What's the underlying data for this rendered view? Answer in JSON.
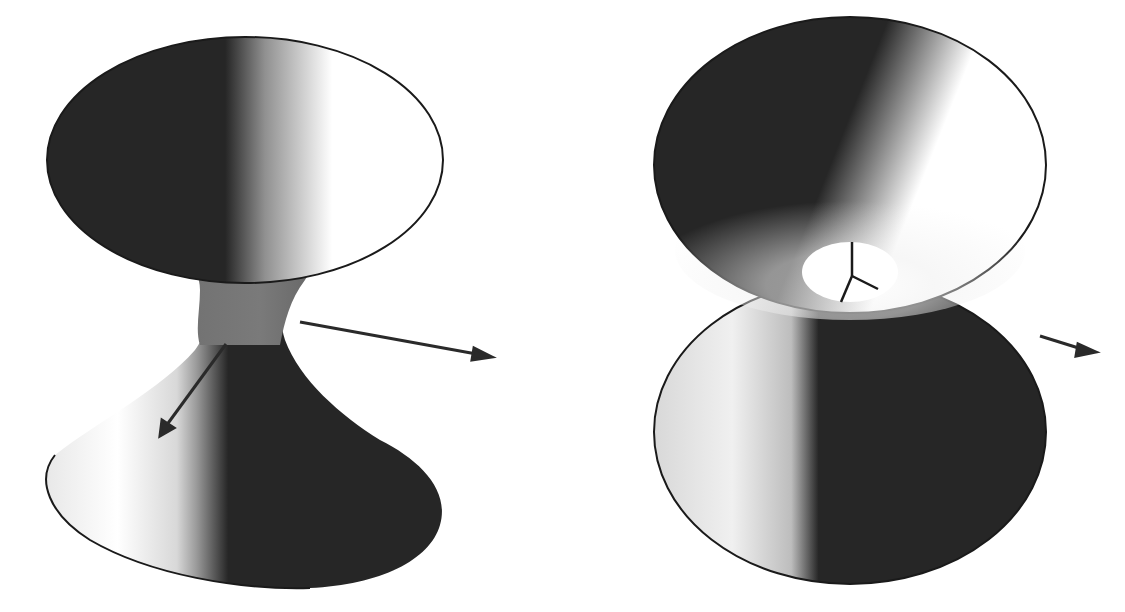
{
  "figures": [
    {
      "id": "left",
      "title": "Hyperboloid of one sheet",
      "description": "Shaded hourglass surface with a narrow waist; two axis arrows emanate from the waist region.",
      "shading": {
        "dark": "#262626",
        "mid": "#8a8a8a",
        "light": "#ffffff"
      },
      "axes": [
        "x-axis-arrow",
        "y-axis-arrow"
      ]
    },
    {
      "id": "right",
      "title": "Hyperboloid of one sheet (top view tilted)",
      "description": "Same surface viewed from above, showing the circular throat opening with three coordinate axes at the center and an arrow to the right.",
      "shading": {
        "dark": "#262626",
        "mid": "#8a8a8a",
        "light": "#ffffff"
      },
      "axes": [
        "x-axis",
        "y-axis",
        "z-axis",
        "x-axis-arrow"
      ]
    }
  ],
  "colors": {
    "background": "#ffffff",
    "surface_dark": "#262626",
    "edge": "#1a1a1a"
  }
}
